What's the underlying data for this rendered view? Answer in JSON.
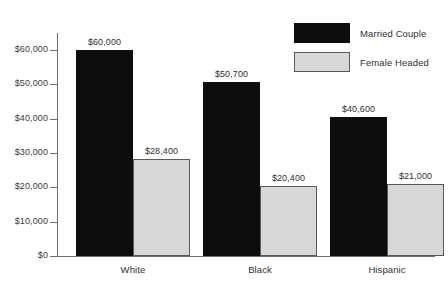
{
  "chart_data": {
    "type": "bar",
    "title": "",
    "subtitle": "",
    "xlabel": "",
    "ylabel": "",
    "categories": [
      "White",
      "Black",
      "Hispanic"
    ],
    "series": [
      {
        "name": "Married Couple",
        "color": "#0d0d0d",
        "values": [
          60000,
          50700,
          40600
        ],
        "labels": [
          "$60,000",
          "$50,700",
          "$40,600"
        ]
      },
      {
        "name": "Female Headed",
        "color": "#d7d7d7",
        "values": [
          28400,
          20400,
          21000
        ],
        "labels": [
          "$28,400",
          "$20,400",
          "$21,000"
        ]
      }
    ],
    "ylim": [
      0,
      65000
    ],
    "yticks": [
      0,
      10000,
      20000,
      30000,
      40000,
      50000,
      60000
    ],
    "ytick_labels": [
      "$0",
      "$10,000",
      "$20,000",
      "$30,000",
      "$40,000",
      "$50,000",
      "$60,000"
    ],
    "grid": false,
    "legend_position": "top-right"
  },
  "legend": {
    "items": [
      {
        "label": "Married Couple"
      },
      {
        "label": "Female Headed"
      }
    ]
  }
}
